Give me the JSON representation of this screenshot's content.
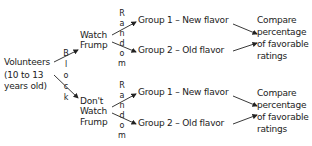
{
  "root": {
    "line1": "Volunteers",
    "line2": "(10 to 13",
    "line3": "years old)"
  },
  "block_label": [
    "B",
    "l",
    "o",
    "c",
    "k"
  ],
  "random_label": [
    "R",
    "a",
    "n",
    "d",
    "o",
    "m"
  ],
  "branches": [
    {
      "treatment": [
        "Watch",
        "Frump"
      ],
      "groups": [
        "Group 1 – New flavor",
        "Group 2 – Old flavor"
      ],
      "outcome": [
        "Compare",
        "percentage",
        "of favorable",
        "ratings"
      ]
    },
    {
      "treatment": [
        "Don't",
        "Watch",
        "Frump"
      ],
      "groups": [
        "Group 1 – New flavor",
        "Group 2 – Old flavor"
      ],
      "outcome": [
        "Compare",
        "percentage",
        "of favorable",
        "ratings"
      ]
    }
  ],
  "colors": {
    "ink": "#222222",
    "background": "#ffffff"
  }
}
